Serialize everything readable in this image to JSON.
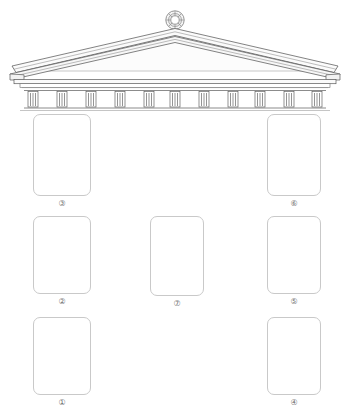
{
  "diagram": {
    "background_color": "#ffffff",
    "line_color": "#5a5a5a",
    "card_border_color": "#c9c9c9",
    "label_color": "#6f6f6f"
  },
  "architecture": {
    "finial": {
      "name": "rosette-acroterion",
      "cx": 175,
      "cy": 20,
      "outer_radius": 9,
      "inner_radius": 4.5,
      "petal_count": 8
    },
    "pediment": {
      "apex_x": 175,
      "apex_y": 30,
      "left_x": 10,
      "right_x": 338,
      "eave_y": 78,
      "raking_lines": 4
    },
    "entablature": {
      "top_y": 80,
      "bottom_y": 92,
      "left_x": 12,
      "right_x": 336
    },
    "colonnade": {
      "top_y": 92,
      "bottom_y": 108,
      "left_x": 26,
      "right_x": 322,
      "column_count": 11,
      "flutes_per_column": 3
    }
  },
  "cards": [
    {
      "id": "card-3",
      "label": "③",
      "number": 3,
      "x": 33,
      "y": 114,
      "w": 58,
      "h": 82
    },
    {
      "id": "card-6",
      "label": "⑥",
      "number": 6,
      "x": 267,
      "y": 114,
      "w": 54,
      "h": 82
    },
    {
      "id": "card-2",
      "label": "②",
      "number": 2,
      "x": 33,
      "y": 216,
      "w": 58,
      "h": 78
    },
    {
      "id": "card-7",
      "label": "⑦",
      "number": 7,
      "x": 150,
      "y": 216,
      "w": 54,
      "h": 80
    },
    {
      "id": "card-5",
      "label": "⑤",
      "number": 5,
      "x": 267,
      "y": 216,
      "w": 54,
      "h": 78
    },
    {
      "id": "card-1",
      "label": "①",
      "number": 1,
      "x": 33,
      "y": 317,
      "w": 58,
      "h": 78
    },
    {
      "id": "card-4",
      "label": "④",
      "number": 4,
      "x": 267,
      "y": 317,
      "w": 54,
      "h": 78
    }
  ]
}
